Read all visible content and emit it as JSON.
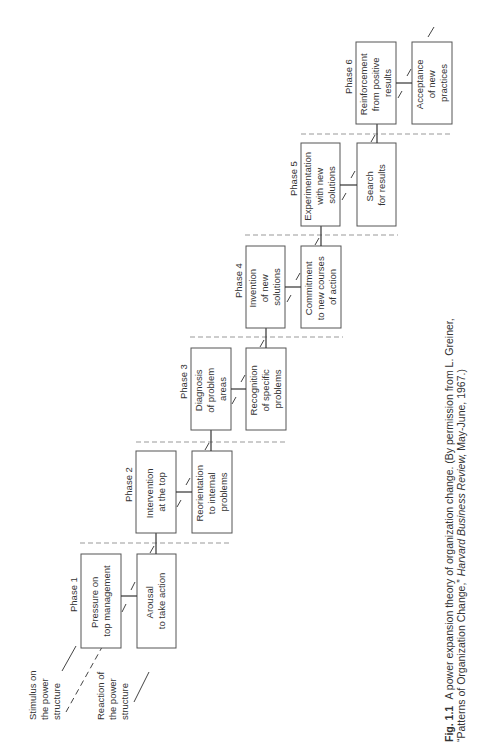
{
  "figure": {
    "legend": {
      "stimulus": [
        "Stimulus on",
        "the power",
        "structure"
      ],
      "reaction": [
        "Reaction of",
        "the power",
        "structure"
      ]
    },
    "phases": [
      {
        "label": "Phase 1",
        "stimulus": [
          "Pressure on",
          "top management"
        ],
        "reaction": [
          "Arousal",
          "to take action"
        ]
      },
      {
        "label": "Phase 2",
        "stimulus": [
          "Intervention",
          "at the top"
        ],
        "reaction": [
          "Reorientation",
          "to internal",
          "problems"
        ]
      },
      {
        "label": "Phase 3",
        "stimulus": [
          "Diagnosis",
          "of problem",
          "areas"
        ],
        "reaction": [
          "Recognition",
          "of specific",
          "problems"
        ]
      },
      {
        "label": "Phase 4",
        "stimulus": [
          "Invention",
          "of new",
          "solutions"
        ],
        "reaction": [
          "Commitment",
          "to new courses",
          "of action"
        ]
      },
      {
        "label": "Phase 5",
        "stimulus": [
          "Experimentation",
          "with new",
          "solutions"
        ],
        "reaction": [
          "Search",
          "for results"
        ]
      },
      {
        "label": "Phase 6",
        "stimulus": [
          "Reinforcement",
          "from positive",
          "results"
        ],
        "reaction": [
          "Acceptance",
          "of new",
          "practices"
        ]
      }
    ],
    "caption": {
      "number": "Fig. 1.1",
      "line1": "A power expansion theory of organization change.  (By permission from L. Greiner,",
      "line2_pre": "“Patterns of Organization Change,” ",
      "line2_journal": "Harvard Business Review,",
      "line2_post": " May-June, 1967.)"
    }
  }
}
